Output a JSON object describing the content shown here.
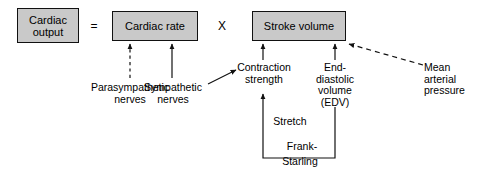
{
  "diagram": {
    "nodes": [
      {
        "id": "cardiac_output",
        "label": "Cardiac\noutput"
      },
      {
        "id": "cardiac_rate",
        "label": "Cardiac rate"
      },
      {
        "id": "stroke_volume",
        "label": "Stroke volume"
      }
    ],
    "operators": {
      "equals": "=",
      "times": "X"
    },
    "labels": {
      "parasympathetic_nerves": "Parasympathetic\nnerves",
      "sympathetic_nerves": "Sympathetic\nnerves",
      "contraction_strength": "Contraction\nstrength",
      "end_diastolic_volume": "End-\ndiastolic\nvolume\n(EDV)",
      "mean_arterial_pressure": "Mean\narterial\npressure",
      "stretch": "Stretch",
      "frank": "Frank-",
      "starling": "Starling"
    },
    "colors": {
      "box_fill": "#c9c9c9",
      "stroke": "#111111",
      "background": "#ffffff",
      "text": "#000000"
    },
    "connections": [
      {
        "id": "parasympathetic-to-cardiac-rate",
        "from": "parasympathetic_nerves",
        "to": "cardiac_rate",
        "style": "dashed",
        "arrow": "up"
      },
      {
        "id": "sympathetic-to-cardiac-rate",
        "from": "sympathetic_nerves",
        "to": "cardiac_rate",
        "style": "solid",
        "arrow": "up"
      },
      {
        "id": "contraction-to-stroke-volume",
        "from": "contraction_strength",
        "to": "stroke_volume",
        "style": "solid",
        "arrow": "up"
      },
      {
        "id": "edv-to-stroke-volume",
        "from": "end_diastolic_volume",
        "to": "stroke_volume",
        "style": "solid",
        "arrow": "up"
      },
      {
        "id": "mean-arterial-pressure-to-stroke-volume",
        "from": "mean_arterial_pressure",
        "to": "stroke_volume",
        "style": "dashed",
        "arrow": "up-left"
      },
      {
        "id": "sympathetic-to-contraction-strength",
        "from": "sympathetic_nerves",
        "to": "contraction_strength",
        "style": "solid",
        "arrow": "up-right"
      },
      {
        "id": "frank-starling-loop",
        "from": "end_diastolic_volume",
        "to": "contraction_strength",
        "style": "solid",
        "arrow": "up",
        "note": "Frank-Starling via Stretch"
      }
    ]
  }
}
